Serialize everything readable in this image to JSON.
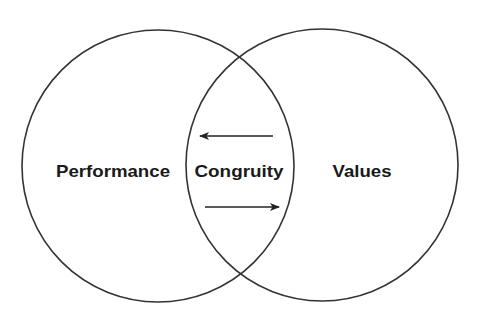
{
  "diagram": {
    "type": "venn",
    "circles": [
      {
        "id": "performance",
        "label": "Performance",
        "cx": 158,
        "cy": 166,
        "r": 136
      },
      {
        "id": "values",
        "label": "Values",
        "cx": 322,
        "cy": 165,
        "r": 136
      }
    ],
    "intersection": {
      "label": "Congruity"
    },
    "arrows": [
      {
        "direction": "left",
        "x1": 273,
        "y1": 136,
        "x2": 200,
        "y2": 136
      },
      {
        "direction": "right",
        "x1": 205,
        "y1": 207,
        "x2": 279,
        "y2": 207
      }
    ],
    "colors": {
      "stroke": "#333333",
      "text": "#1a1a1a",
      "background": "#ffffff"
    }
  }
}
